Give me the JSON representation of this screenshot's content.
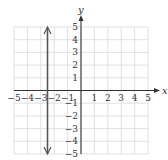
{
  "chart_data": {
    "type": "line",
    "title": "",
    "xlabel": "x",
    "ylabel": "y",
    "xlim": [
      -5,
      5
    ],
    "ylim": [
      -5,
      5
    ],
    "grid": true,
    "x_ticks": [
      -5,
      -4,
      -3,
      -2,
      -1,
      1,
      2,
      3,
      4,
      5
    ],
    "y_ticks": [
      -5,
      -4,
      -3,
      -2,
      -1,
      1,
      2,
      3,
      4,
      5
    ],
    "x_tick_labels": [
      "−5",
      "−4",
      "−3",
      "−2",
      "−1",
      "1",
      "2",
      "3",
      "4",
      "5"
    ],
    "y_tick_labels": [
      "−5",
      "−4",
      "−3",
      "−2",
      "−1",
      "1",
      "2",
      "3",
      "4",
      "5"
    ],
    "series": [
      {
        "name": "vertical line",
        "equation": "x = -2.5",
        "x": [
          -2.5,
          -2.5
        ],
        "y": [
          -5,
          5
        ],
        "arrows": "both ends",
        "color": "#555555"
      }
    ],
    "legend": null
  },
  "colors": {
    "grid": "#d9d9d9",
    "axis": "#333333",
    "line": "#555555"
  }
}
